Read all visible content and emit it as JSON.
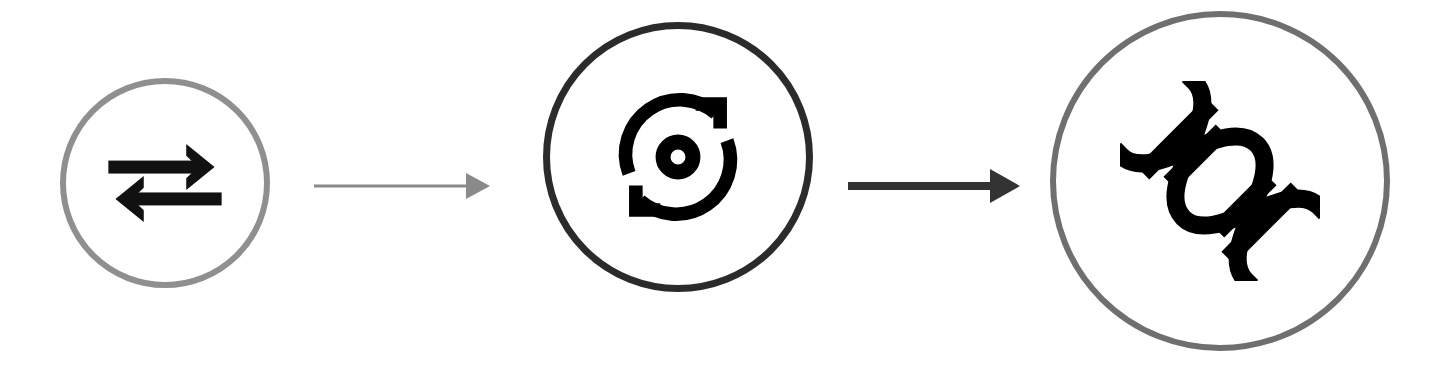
{
  "canvas": {
    "width": 1433,
    "height": 382,
    "background": "#ffffff"
  },
  "diagram": {
    "type": "linear-process-flow",
    "orientation": "horizontal",
    "step_count": 3,
    "connector_count": 2,
    "nodes": [
      {
        "id": "stage-1",
        "order": 1,
        "shape": "circle",
        "icon_name": "exchange-arrows-icon",
        "icon_description": "two horizontal arrows, upper pointing right and lower pointing left",
        "x": 60,
        "y": 78,
        "diameter": 210,
        "border_width": 6,
        "border_color": "#8f8f8f",
        "fill_color": "#ffffff",
        "icon_color": "#111111",
        "icon_size": 118
      },
      {
        "id": "stage-2",
        "order": 2,
        "shape": "circle",
        "icon_name": "rotate-sync-icon",
        "icon_description": "two curved rotation arrows encircling a small ring",
        "x": 543,
        "y": 22,
        "diameter": 270,
        "border_width": 7,
        "border_color": "#2b2b2b",
        "fill_color": "#ffffff",
        "icon_color": "#000000",
        "icon_size": 136
      },
      {
        "id": "stage-3",
        "order": 3,
        "shape": "circle",
        "icon_name": "dna-helix-icon",
        "icon_description": "bold diagonal DNA double helix with cross rungs",
        "x": 1050,
        "y": 11,
        "diameter": 340,
        "border_width": 6,
        "border_color": "#6f6f6f",
        "fill_color": "#ffffff",
        "icon_color": "#000000",
        "icon_size": 200
      }
    ],
    "connectors": [
      {
        "id": "connector-1",
        "from": "stage-1",
        "to": "stage-2",
        "direction": "right",
        "x": 314,
        "y": 168,
        "width": 176,
        "height": 36,
        "color": "#8a8a8a",
        "line_thickness": 3,
        "head_length": 24,
        "head_half_height": 13
      },
      {
        "id": "connector-2",
        "from": "stage-2",
        "to": "stage-3",
        "direction": "right",
        "x": 848,
        "y": 166,
        "width": 172,
        "height": 40,
        "color": "#333333",
        "line_thickness": 8,
        "head_length": 30,
        "head_half_height": 17
      }
    ]
  }
}
